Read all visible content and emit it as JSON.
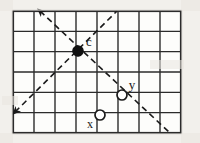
{
  "figure": {
    "background_color": "#fdfdfb",
    "ink_color": "#1a1a1a",
    "grid": {
      "x0": 13,
      "y0": 11,
      "x1": 181,
      "y1": 133,
      "columns": 8,
      "rows": 6,
      "cell_width": 21,
      "cell_height": 20.333,
      "line_color": "#2b2b2b",
      "inner_line_width": 1.4,
      "border_line_width": 2.2
    },
    "points": [
      {
        "id": "c",
        "label": "c",
        "style": "filled",
        "cx": 78,
        "cy": 51,
        "r": 5.2,
        "fill": "#111111",
        "stroke": "#111111",
        "label_x": 89,
        "label_y": 46,
        "label_size": 13
      },
      {
        "id": "y",
        "label": "y",
        "style": "open",
        "cx": 122,
        "cy": 95,
        "r": 5.0,
        "fill": "#ffffff",
        "stroke": "#1a1a1a",
        "label_x": 132,
        "label_y": 89,
        "label_size": 13
      },
      {
        "id": "x",
        "label": "x",
        "style": "open",
        "cx": 100,
        "cy": 115,
        "r": 5.0,
        "fill": "#ffffff",
        "stroke": "#1a1a1a",
        "label_x": 90,
        "label_y": 128,
        "label_size": 12
      }
    ],
    "dashed_lines": [
      {
        "id": "diagonal-descending",
        "description": "dashed diagonal from upper-left through c, x-y region, to lower-right",
        "from_x": 40,
        "from_y": 11,
        "to_x": 170,
        "to_y": 133,
        "dash": "6 4",
        "width": 1.6,
        "stroke": "#1a1a1a",
        "arrow_start": true,
        "arrow_end": false
      },
      {
        "id": "diagonal-ascending",
        "description": "dashed diagonal from lower-left through c to upper-right",
        "from_x": 15,
        "from_y": 112,
        "to_x": 117,
        "to_y": 11,
        "dash": "6 4",
        "width": 1.6,
        "stroke": "#1a1a1a",
        "arrow_start": true,
        "arrow_end": false
      }
    ],
    "scan_artifacts": [
      {
        "x": 0,
        "y": 0,
        "w": 13,
        "h": 143
      },
      {
        "x": 181,
        "y": 0,
        "w": 19,
        "h": 143
      },
      {
        "x": 0,
        "y": 0,
        "w": 200,
        "h": 11
      },
      {
        "x": 0,
        "y": 133,
        "w": 200,
        "h": 10
      },
      {
        "x": 2,
        "y": 96,
        "w": 16,
        "h": 9
      },
      {
        "x": 150,
        "y": 60,
        "w": 34,
        "h": 9
      }
    ]
  },
  "chart_data": {
    "type": "scatter",
    "xlabel": "",
    "ylabel": "",
    "grid": true,
    "legend_position": "none",
    "xlim": [
      0,
      8
    ],
    "ylim": [
      0,
      6
    ],
    "categories": [
      "c",
      "y",
      "x"
    ],
    "series": [
      {
        "name": "center point (filled)",
        "points": [
          {
            "label": "c",
            "x": 3,
            "y": 4
          }
        ]
      },
      {
        "name": "lattice points (open)",
        "points": [
          {
            "label": "y",
            "x": 5.2,
            "y": 1.85
          },
          {
            "label": "x",
            "x": 4.15,
            "y": 0.85
          }
        ]
      }
    ],
    "annotations": [
      {
        "text": "c",
        "x": 3.6,
        "y": 4.35
      },
      {
        "text": "y",
        "x": 5.7,
        "y": 2.2
      },
      {
        "text": "x",
        "x": 3.65,
        "y": 0.35
      }
    ],
    "reference_lines": [
      {
        "name": "descending diagonal",
        "slope": -0.94,
        "style": "dashed",
        "through": "c"
      },
      {
        "name": "ascending diagonal",
        "slope": 0.98,
        "style": "dashed",
        "through": "c"
      }
    ]
  }
}
